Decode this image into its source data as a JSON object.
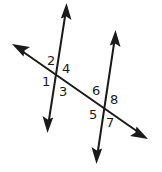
{
  "figure": {
    "background_color": "#ffffff",
    "stroke_color": "#1a1a1a",
    "label_color": "#1a1a1a",
    "stroke_width": 2,
    "width": 162,
    "height": 172
  },
  "lines": [
    {
      "name": "parallel-line-left",
      "kind": "parallel",
      "x1": 66,
      "y1": 4,
      "x2": 48,
      "y2": 132,
      "arrow_start": true,
      "arrow_end": true
    },
    {
      "name": "parallel-line-right",
      "kind": "parallel",
      "x1": 115,
      "y1": 31,
      "x2": 97,
      "y2": 163,
      "arrow_start": true,
      "arrow_end": true
    },
    {
      "name": "transversal-line",
      "kind": "transversal",
      "x1": 13,
      "y1": 45,
      "x2": 147,
      "y2": 138,
      "arrow_start": true,
      "arrow_end": true
    }
  ],
  "intersections": [
    {
      "name": "intersection-left",
      "x": 57,
      "y": 76
    },
    {
      "name": "intersection-right",
      "x": 107,
      "y": 111
    }
  ],
  "angle_labels": [
    {
      "id": "angle-1",
      "text": "1",
      "x": 42,
      "y": 75,
      "position": "left-intersection-west"
    },
    {
      "id": "angle-2",
      "text": "2",
      "x": 47,
      "y": 54,
      "position": "left-intersection-north-west"
    },
    {
      "id": "angle-3",
      "text": "3",
      "x": 59,
      "y": 85,
      "position": "left-intersection-south-east"
    },
    {
      "id": "angle-4",
      "text": "4",
      "x": 62,
      "y": 62,
      "position": "left-intersection-north-east"
    },
    {
      "id": "angle-5",
      "text": "5",
      "x": 89,
      "y": 108,
      "position": "right-intersection-south-west"
    },
    {
      "id": "angle-6",
      "text": "6",
      "x": 92,
      "y": 84,
      "position": "right-intersection-north-west"
    },
    {
      "id": "angle-7",
      "text": "7",
      "x": 106,
      "y": 116,
      "position": "right-intersection-south-east"
    },
    {
      "id": "angle-8",
      "text": "8",
      "x": 110,
      "y": 93,
      "position": "right-intersection-north-east"
    }
  ]
}
